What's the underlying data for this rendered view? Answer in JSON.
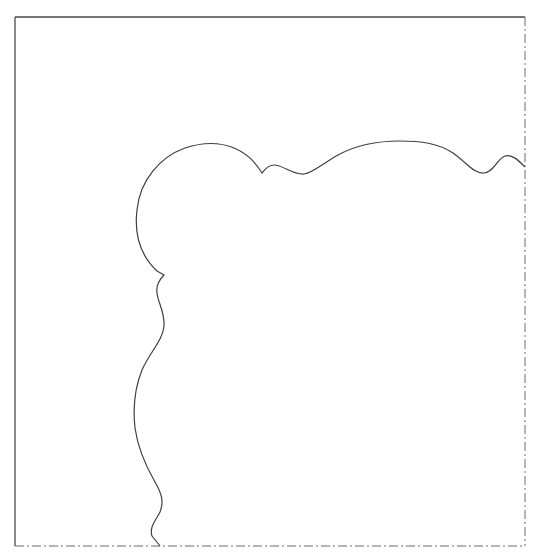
{
  "drawing": {
    "background": "#ffffff",
    "stroke_color": "#4a4a4a",
    "frame": {
      "left": 15,
      "top": 17,
      "right": 525,
      "bottom": 546,
      "solid_edges": [
        "top",
        "left"
      ],
      "dashdot_edges": [
        "right",
        "bottom"
      ],
      "dash_pattern": "9 3 2 3"
    },
    "shape": {
      "description": "freeform wavy outline from right edge to bottom edge",
      "start_point": [
        525,
        167
      ],
      "end_point": [
        160,
        546
      ],
      "path": "M525,167 C518,160 512,154 505,156 C497,159 494,172 484,173 C474,174 466,162 453,153 C438,143 420,141 400,141 C378,141 356,145 338,155 C322,164 313,173 304,174 C293,175 283,165 274,165 C267,165 264,171 262,173 C255,162 248,154 234,148 C217,141 200,143 185,148 C160,157 140,180 137,210 C134,235 141,256 157,271 L164,275 C159,280 156,286 157,293 C158,303 165,312 164,326 C163,340 150,352 142,370 C134,390 133,410 135,428 C138,450 147,468 155,482 C162,494 164,502 160,512 C156,520 149,527 152,536 L160,546"
    }
  }
}
